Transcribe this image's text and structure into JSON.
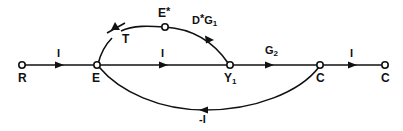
{
  "figure": {
    "type": "signal-flow-graph",
    "background_color": "#ffffff",
    "stroke_color": "#111111"
  },
  "nodes": [
    {
      "id": "R",
      "label": "R",
      "x": 22,
      "y": 65,
      "label_x": 18,
      "label_y": 72
    },
    {
      "id": "E",
      "label": "E",
      "x": 97,
      "y": 65,
      "label_x": 92,
      "label_y": 72
    },
    {
      "id": "Estar",
      "label": "E",
      "superscript": "*",
      "x": 165,
      "y": 27,
      "label_x": 158,
      "label_y": 6
    },
    {
      "id": "Y1",
      "label": "Y",
      "subscript": "1",
      "x": 230,
      "y": 65,
      "label_x": 224,
      "label_y": 72
    },
    {
      "id": "C1",
      "label": "C",
      "x": 320,
      "y": 65,
      "label_x": 316,
      "label_y": 72
    },
    {
      "id": "C2",
      "label": "C",
      "x": 385,
      "y": 65,
      "label_x": 381,
      "label_y": 72
    }
  ],
  "edges": [
    {
      "id": "R-E",
      "label": "I",
      "from": "R",
      "to": "E",
      "shape": "straight",
      "label_x": 57,
      "label_y": 48
    },
    {
      "id": "E-Y1",
      "label": "I",
      "from": "E",
      "to": "Y1",
      "shape": "straight",
      "label_x": 161,
      "label_y": 48
    },
    {
      "id": "Y1-C1",
      "label": "G",
      "subscript": "2",
      "from": "Y1",
      "to": "C1",
      "shape": "straight",
      "label_x": 265,
      "label_y": 45
    },
    {
      "id": "C1-C2",
      "label": "I",
      "from": "C1",
      "to": "C2",
      "shape": "straight",
      "label_x": 350,
      "label_y": 48
    },
    {
      "id": "E-Estar-Y1",
      "label": "D",
      "superscript": "*",
      "label2": "G",
      "subscript": "1",
      "from": "E",
      "to": "Y1",
      "shape": "arc-upper",
      "label_x": 192,
      "label_y": 13
    },
    {
      "id": "C1-E",
      "label": "-I",
      "from": "C1",
      "to": "E",
      "shape": "arc-lower",
      "label_x": 199,
      "label_y": 114
    }
  ],
  "annotations": [
    {
      "id": "switch-T",
      "label": "T",
      "label_x": 122,
      "label_y": 33,
      "icon": "switch-break-mark"
    }
  ]
}
